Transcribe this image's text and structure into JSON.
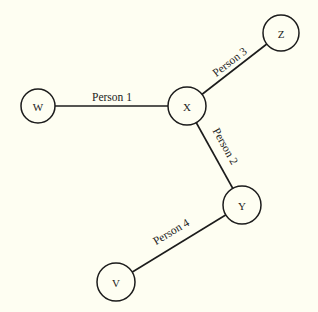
{
  "diagram": {
    "type": "graph",
    "background": "#fefef2",
    "stroke_color": "#1c1c1c",
    "nodes": [
      {
        "id": "W",
        "label": "W",
        "x": 38,
        "y": 106,
        "r": 17
      },
      {
        "id": "X",
        "label": "X",
        "x": 187,
        "y": 106,
        "r": 19
      },
      {
        "id": "Z",
        "label": "Z",
        "x": 281,
        "y": 33,
        "r": 18
      },
      {
        "id": "Y",
        "label": "Y",
        "x": 242,
        "y": 205,
        "r": 19
      },
      {
        "id": "V",
        "label": "V",
        "x": 116,
        "y": 282,
        "r": 19
      }
    ],
    "edges": [
      {
        "from": "W",
        "to": "X",
        "label": "Person 1",
        "label_x": 112,
        "label_y": 101,
        "label_rotate": 0
      },
      {
        "from": "X",
        "to": "Z",
        "label": "Person 3",
        "label_x": 232,
        "label_y": 65,
        "label_rotate": -38
      },
      {
        "from": "X",
        "to": "Y",
        "label": "Person 2",
        "label_x": 222,
        "label_y": 148,
        "label_rotate": 61
      },
      {
        "from": "Y",
        "to": "V",
        "label": "Person 4",
        "label_x": 173,
        "label_y": 235,
        "label_rotate": -31
      }
    ]
  }
}
